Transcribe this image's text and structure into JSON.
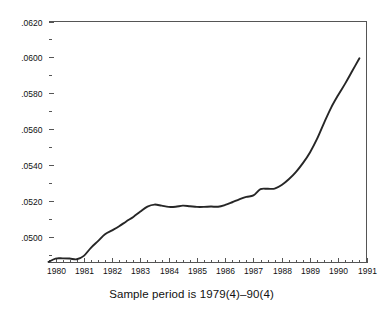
{
  "caption": {
    "text": "Sample period is 1979(4)–90(4)"
  },
  "chart_data": {
    "type": "line",
    "title": "",
    "subtitle": "",
    "xlabel": "",
    "ylabel": "",
    "annotation": "Sample period is 1979(4)–90(4)",
    "grid": false,
    "legend": false,
    "legend_position": "none",
    "line_color": "#262626",
    "axis_color": "#555555",
    "background": "#ffffff",
    "xlim": [
      1979.75,
      1991.0
    ],
    "ylim": [
      0.04856,
      0.062
    ],
    "y_ticks": [
      0.05,
      0.052,
      0.054,
      0.056,
      0.058,
      0.06,
      0.062
    ],
    "y_tick_labels": [
      ".0500",
      ".0520",
      ".0540",
      ".0560",
      ".0580",
      ".0600",
      ".0620"
    ],
    "y_minor_tick_step": 0.001,
    "x_ticks": [
      1980,
      1981,
      1982,
      1983,
      1984,
      1985,
      1986,
      1987,
      1988,
      1989,
      1990,
      1991
    ],
    "x_tick_labels": [
      "1980",
      "1981",
      "1982",
      "1983",
      "1984",
      "1985",
      "1986",
      "1987",
      "1988",
      "1989",
      "1990",
      "1991"
    ],
    "x_minor_tick_step": 0.25,
    "series": [
      {
        "name": "series-1",
        "x": [
          1979.75,
          1980.0,
          1980.25,
          1980.5,
          1980.75,
          1981.0,
          1981.25,
          1981.5,
          1981.75,
          1982.0,
          1982.25,
          1982.5,
          1982.75,
          1983.0,
          1983.25,
          1983.5,
          1983.75,
          1984.0,
          1984.25,
          1984.5,
          1984.75,
          1985.0,
          1985.25,
          1985.5,
          1985.75,
          1986.0,
          1986.25,
          1986.5,
          1986.75,
          1987.0,
          1987.25,
          1987.5,
          1987.75,
          1988.0,
          1988.25,
          1988.5,
          1988.75,
          1989.0,
          1989.25,
          1989.5,
          1989.75,
          1990.0,
          1990.25,
          1990.5,
          1990.75
        ],
        "values": [
          0.04859,
          0.04878,
          0.04879,
          0.04878,
          0.04874,
          0.04893,
          0.04938,
          0.04975,
          0.05013,
          0.05035,
          0.05058,
          0.05085,
          0.0511,
          0.0514,
          0.05168,
          0.05179,
          0.05173,
          0.05166,
          0.05167,
          0.05173,
          0.0517,
          0.05166,
          0.05166,
          0.05168,
          0.05167,
          0.05177,
          0.05192,
          0.05208,
          0.05222,
          0.0523,
          0.05265,
          0.05267,
          0.05268,
          0.05288,
          0.0532,
          0.0536,
          0.0541,
          0.0547,
          0.05545,
          0.05635,
          0.0572,
          0.0579,
          0.05855,
          0.05925,
          0.05995
        ]
      }
    ]
  }
}
